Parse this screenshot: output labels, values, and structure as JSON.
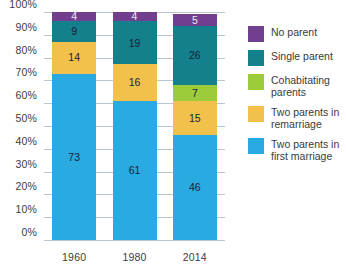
{
  "chart_data": {
    "type": "bar",
    "title": "",
    "subtitle": "",
    "xlabel": "",
    "ylabel": "",
    "stacked": true,
    "stack_total": 100,
    "grid": true,
    "legend_position": "right",
    "ylim": [
      0,
      100
    ],
    "categories": [
      "1960",
      "1980",
      "2014"
    ],
    "ytick_labels": [
      "100%",
      "90%",
      "80%",
      "70%",
      "60%",
      "50%",
      "40%",
      "30%",
      "20%",
      "10%",
      "0%"
    ],
    "ytick_values": [
      100,
      90,
      80,
      70,
      60,
      50,
      40,
      30,
      20,
      10,
      0
    ],
    "series": [
      {
        "name": "Two parents in first marriage",
        "color": "#29abe2",
        "label_color": "dark",
        "values": [
          73,
          61,
          46
        ]
      },
      {
        "name": "Two parents in remarriage",
        "color": "#f2c14b",
        "label_color": "dark",
        "values": [
          14,
          16,
          15
        ]
      },
      {
        "name": "Cohabitating parents",
        "color": "#9ccb3b",
        "label_color": "dark",
        "values": [
          0,
          0,
          7
        ]
      },
      {
        "name": "Single parent",
        "color": "#14808c",
        "label_color": "dark",
        "values": [
          9,
          19,
          26
        ]
      },
      {
        "name": "No parent",
        "color": "#713f8e",
        "label_color": "light",
        "values": [
          4,
          4,
          5
        ]
      }
    ],
    "legend": [
      {
        "label": "No parent",
        "color": "#713f8e"
      },
      {
        "label": "Single parent",
        "color": "#14808c"
      },
      {
        "label": "Cohabitating parents",
        "color": "#9ccb3b"
      },
      {
        "label": "Two parents in remarriage",
        "color": "#f2c14b"
      },
      {
        "label": "Two parents in first marriage",
        "color": "#29abe2"
      }
    ],
    "colors": {
      "gridline": "#b9c6d4",
      "background": "#ffffff",
      "tick_text": "#3c3c3c",
      "legend_text": "#3a3a3a"
    }
  }
}
